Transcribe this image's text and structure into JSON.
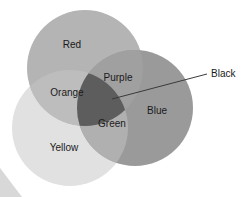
{
  "diagram": {
    "type": "venn-3-set",
    "canvas": {
      "width": 252,
      "height": 197,
      "background": "#ffffff"
    },
    "sets": [
      {
        "key": "red",
        "label": "Red",
        "fill": "#b4b4b4",
        "cx": 85,
        "cy": 68,
        "r": 58,
        "label_x": 72,
        "label_y": 45
      },
      {
        "key": "blue",
        "label": "Blue",
        "fill": "#9a9a9a",
        "cx": 135,
        "cy": 108,
        "r": 58,
        "label_x": 157,
        "label_y": 111
      },
      {
        "key": "yellow",
        "label": "Yellow",
        "fill": "#e1e1e1",
        "cx": 70,
        "cy": 128,
        "r": 58,
        "label_x": 64,
        "label_y": 148
      }
    ],
    "intersections": [
      {
        "key": "purple",
        "label": "Purple",
        "of": [
          "red",
          "blue"
        ],
        "fill": "#a0a0a0",
        "label_x": 118,
        "label_y": 78
      },
      {
        "key": "orange",
        "label": "Orange",
        "of": [
          "red",
          "yellow"
        ],
        "fill": "#bdbdbd",
        "label_x": 67,
        "label_y": 93
      },
      {
        "key": "green",
        "label": "Green",
        "of": [
          "blue",
          "yellow"
        ],
        "fill": "#b0b0b0",
        "label_x": 112,
        "label_y": 124
      },
      {
        "key": "black",
        "label": "Black",
        "of": [
          "red",
          "blue",
          "yellow"
        ],
        "fill": "#5d5d5d",
        "label_x": 211,
        "label_y": 74
      }
    ],
    "callout": {
      "label": "Black",
      "stroke": "#3a3a3a",
      "x1": 112,
      "y1": 99,
      "x2": 207,
      "y2": 74
    },
    "corner_artifact": {
      "fill": "#d8d8d8",
      "points": "0,168 22,197 0,197"
    }
  }
}
